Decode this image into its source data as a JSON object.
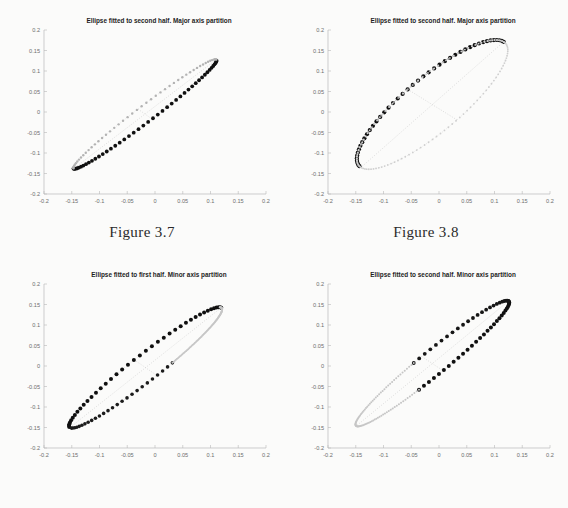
{
  "page": {
    "background_color": "#fbfbfa",
    "width": 568,
    "height": 508
  },
  "figures": [
    {
      "id": "figure-3-7",
      "position": "top-left",
      "caption": "Figure 3.7",
      "chart_data": {
        "type": "scatter",
        "title": "Ellipse fitted to second half. Major axis partition",
        "xlabel": "",
        "ylabel": "",
        "xlim": [
          -0.2,
          0.2
        ],
        "ylim": [
          -0.2,
          0.2
        ],
        "xticks": [
          -0.2,
          -0.15,
          -0.1,
          -0.05,
          0,
          0.05,
          0.1,
          0.15,
          0.2
        ],
        "yticks": [
          -0.2,
          -0.15,
          -0.1,
          -0.05,
          0,
          0.05,
          0.1,
          0.15,
          0.2
        ],
        "xticklabels": [
          "-0.2",
          "-0.15",
          "-0.1",
          "-0.05",
          "0",
          "0.05",
          "0.1",
          "0.15",
          "0.2"
        ],
        "yticklabels": [
          "-0.2",
          "-0.15",
          "-0.1",
          "-0.05",
          "0",
          "0.05",
          "0.1",
          "0.15",
          "0.2"
        ],
        "grid": false,
        "legend": "none",
        "ellipse": {
          "center_x": -0.018,
          "center_y": -0.005,
          "semi_major": 0.185,
          "semi_minor": 0.0175,
          "rotation_deg": 46.0
        },
        "series": [
          {
            "name": "upper-branch-data",
            "marker": "dot",
            "color": "#101010",
            "size": 1.9,
            "note": "dense dark markers along upper-left flank of ellipse",
            "branch": "upper",
            "count": 46,
            "t_start_deg": 178,
            "t_end_deg": 352
          },
          {
            "name": "lower-branch-fit",
            "marker": "dot",
            "color": "#b3b3b3",
            "size": 1.2,
            "note": "faint markers along lower-right flank of ellipse",
            "branch": "lower",
            "count": 48,
            "t_start_deg": 0,
            "t_end_deg": 178
          }
        ],
        "axis_cross": {
          "major_axis": true,
          "minor_axis": true,
          "partition": "major"
        }
      }
    },
    {
      "id": "figure-3-8",
      "position": "top-right",
      "caption": "Figure 3.8",
      "chart_data": {
        "type": "scatter",
        "title": "Ellipse fitted to second half. Major axis partition",
        "xlabel": "",
        "ylabel": "",
        "xlim": [
          -0.2,
          0.2
        ],
        "ylim": [
          -0.2,
          0.2
        ],
        "xticks": [
          -0.2,
          -0.15,
          -0.1,
          -0.05,
          0,
          0.05,
          0.1,
          0.15,
          0.2
        ],
        "yticks": [
          -0.2,
          -0.15,
          -0.1,
          -0.05,
          0,
          0.05,
          0.1,
          0.15,
          0.2
        ],
        "xticklabels": [
          "-0.2",
          "-0.15",
          "-0.1",
          "-0.05",
          "0",
          "0.05",
          "0.1",
          "0.15",
          "0.2"
        ],
        "yticklabels": [
          "-0.2",
          "-0.15",
          "-0.1",
          "-0.05",
          "0",
          "0.05",
          "0.1",
          "0.15",
          "0.2"
        ],
        "grid": false,
        "legend": "none",
        "ellipse": {
          "center_x": -0.012,
          "center_y": 0.018,
          "semi_major": 0.2,
          "semi_minor": 0.058,
          "rotation_deg": 50.0
        },
        "series": [
          {
            "name": "lower-right-branch-data",
            "marker": "dot",
            "color": "#101010",
            "size": 2.1,
            "note": "dark heavy markers along lower-right flank",
            "branch": "lower",
            "count": 44,
            "t_start_deg": 0,
            "t_end_deg": 176
          },
          {
            "name": "inner-fit-dots",
            "marker": "dot",
            "color": "#9c9c9c",
            "size": 1.1,
            "note": "faint inner dotted arc",
            "branch": "inner",
            "count": 46,
            "t_start_deg": 0,
            "t_end_deg": 176
          },
          {
            "name": "outer-ellipse-outline",
            "marker": "dot",
            "color": "#cfcfcf",
            "size": 0.9,
            "note": "faint full outer ellipse outline",
            "branch": "outline",
            "count": 120,
            "t_start_deg": 0,
            "t_end_deg": 360
          }
        ],
        "axis_cross": {
          "major_axis": true,
          "minor_axis": true,
          "partition": "major"
        }
      }
    },
    {
      "id": "figure-bottom-left",
      "position": "bottom-left",
      "caption": "",
      "chart_data": {
        "type": "scatter",
        "title": "Ellipse fitted to first half. Minor axis partition",
        "xlabel": "",
        "ylabel": "",
        "xlim": [
          -0.2,
          0.2
        ],
        "ylim": [
          -0.2,
          0.2
        ],
        "xticks": [
          -0.2,
          -0.15,
          -0.1,
          -0.05,
          0,
          0.05,
          0.1,
          0.15,
          0.2
        ],
        "yticks": [
          -0.2,
          -0.15,
          -0.1,
          -0.05,
          0,
          0.05,
          0.1,
          0.15,
          0.2
        ],
        "xticklabels": [
          "-0.2",
          "-0.15",
          "-0.1",
          "-0.05",
          "0",
          "0.05",
          "0.1",
          "0.15",
          "0.2"
        ],
        "yticklabels": [
          "-0.2",
          "-0.15",
          "-0.1",
          "-0.05",
          "0",
          "0.05",
          "0.1",
          "0.15",
          "0.2"
        ],
        "grid": false,
        "legend": "none",
        "ellipse": {
          "center_x": -0.017,
          "center_y": -0.004,
          "semi_major": 0.2,
          "semi_minor": 0.028,
          "rotation_deg": 47.0
        },
        "series": [
          {
            "name": "first-half-data",
            "marker": "dot",
            "color": "#101010",
            "size": 2.0,
            "note": "dark markers along lower-left half of ellipse",
            "branch": "lower",
            "count": 40,
            "t_start_deg": 0,
            "t_end_deg": 176
          },
          {
            "name": "upper-branch-data",
            "marker": "dot",
            "color": "#1c1c1c",
            "size": 1.8,
            "note": "dark markers along upper-left flank",
            "branch": "upper",
            "count": 26,
            "t_start_deg": 186,
            "t_end_deg": 282
          },
          {
            "name": "ellipse-outline-faint",
            "marker": "dot",
            "color": "#c6c6c6",
            "size": 1.0,
            "note": "faint dotted continuation toward upper right tip",
            "branch": "outline",
            "count": 96,
            "t_start_deg": 282,
            "t_end_deg": 366
          }
        ],
        "axis_cross": {
          "major_axis": true,
          "minor_axis": true,
          "partition": "minor"
        }
      }
    },
    {
      "id": "figure-bottom-right",
      "position": "bottom-right",
      "caption": "",
      "chart_data": {
        "type": "scatter",
        "title": "Ellipse fitted to second half. Minor axis partition",
        "xlabel": "",
        "ylabel": "",
        "xlim": [
          -0.2,
          0.2
        ],
        "ylim": [
          -0.2,
          0.2
        ],
        "xticks": [
          -0.2,
          -0.15,
          -0.1,
          -0.05,
          0,
          0.05,
          0.1,
          0.15,
          0.2
        ],
        "yticks": [
          -0.2,
          -0.15,
          -0.1,
          -0.05,
          0,
          0.05,
          0.1,
          0.15,
          0.2
        ],
        "xticklabels": [
          "-0.2",
          "-0.15",
          "-0.1",
          "-0.05",
          "0",
          "0.05",
          "0.1",
          "0.15",
          "0.2"
        ],
        "yticklabels": [
          "-0.2",
          "-0.15",
          "-0.1",
          "-0.05",
          "0",
          "0.05",
          "0.1",
          "0.15",
          "0.2"
        ],
        "grid": false,
        "legend": "none",
        "ellipse": {
          "center_x": -0.012,
          "center_y": 0.006,
          "semi_major": 0.205,
          "semi_minor": 0.026,
          "rotation_deg": 48.0
        },
        "series": [
          {
            "name": "second-half-data",
            "marker": "dot",
            "color": "#101010",
            "size": 2.0,
            "note": "dark markers along upper-right portion of both flanks",
            "branch": "upper",
            "count": 30,
            "t_start_deg": 252,
            "t_end_deg": 360
          },
          {
            "name": "second-half-data-lower",
            "marker": "dot",
            "color": "#161616",
            "size": 1.9,
            "note": "dark markers on lower-right flank",
            "branch": "lower",
            "count": 24,
            "t_start_deg": 0,
            "t_end_deg": 96
          },
          {
            "name": "ellipse-outline-faint",
            "marker": "dot",
            "color": "#c6c6c6",
            "size": 1.0,
            "note": "faint dotted tail toward lower-left",
            "branch": "outline",
            "count": 90,
            "t_start_deg": 96,
            "t_end_deg": 252
          }
        ],
        "axis_cross": {
          "major_axis": true,
          "minor_axis": true,
          "partition": "minor"
        }
      }
    }
  ]
}
